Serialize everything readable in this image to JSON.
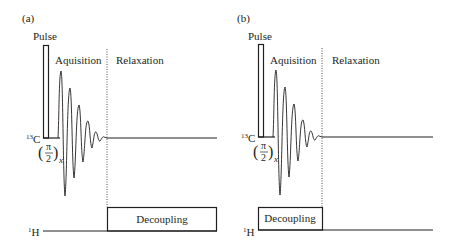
{
  "figure": {
    "panels": [
      {
        "id": "a",
        "label": "(a)",
        "pulse_label": "Pulse",
        "acquisition_label": "Aquisition",
        "relaxation_label": "Relaxation",
        "carbon_label_sup": "13",
        "carbon_label": "C",
        "proton_label_sup": "1",
        "proton_label": "H",
        "pulse_angle_num": "π",
        "pulse_angle_den": "2",
        "pulse_axis": "x",
        "decoupling_label": "Decoupling",
        "decoupling_during": "relaxation"
      },
      {
        "id": "b",
        "label": "(b)",
        "pulse_label": "Pulse",
        "acquisition_label": "Aquisition",
        "relaxation_label": "Relaxation",
        "carbon_label_sup": "13",
        "carbon_label": "C",
        "proton_label_sup": "1",
        "proton_label": "H",
        "pulse_angle_num": "π",
        "pulse_angle_den": "2",
        "pulse_axis": "x",
        "decoupling_label": "Decoupling",
        "decoupling_during": "acquisition"
      }
    ],
    "colors": {
      "line": "#231f20",
      "background": "#ffffff"
    }
  }
}
